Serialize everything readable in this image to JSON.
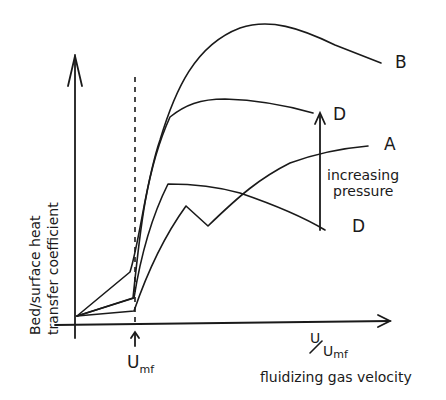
{
  "figure": {
    "type": "schematic qualitative plot",
    "ylabel_line1": "Bed/surface heat",
    "ylabel_line2": "transfer coefficient",
    "xlabel_ratio_num": "U",
    "xlabel_ratio_den": "U",
    "xlabel_ratio_den_sub": "mf",
    "xlabel": "fluidizing gas velocity",
    "umf_marker": "U",
    "umf_marker_sub": "mf",
    "annotation_line1": "increasing",
    "annotation_line2": "pressure",
    "curve_labels": {
      "B": "B",
      "D_upper": "D",
      "A": "A",
      "D_lower": "D"
    },
    "stroke_color": "#1a1a1a",
    "background_color": "#ffffff"
  }
}
